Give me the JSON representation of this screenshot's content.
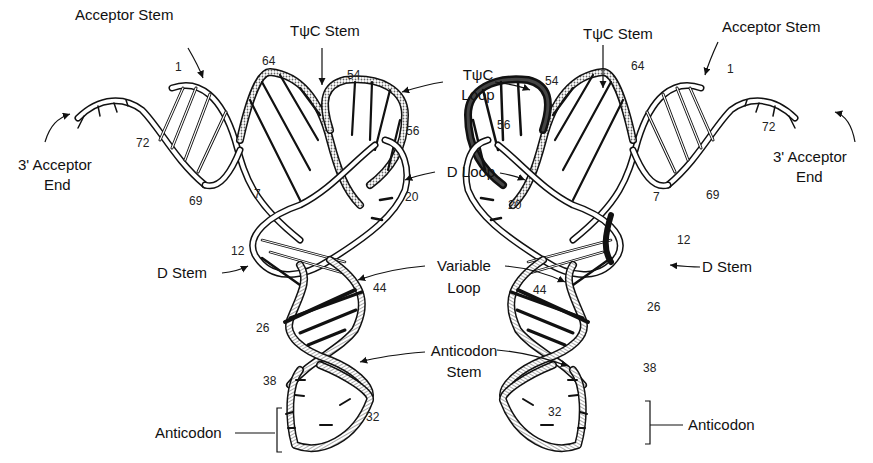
{
  "figure": {
    "colors": {
      "ink": "#111111",
      "background": "#ffffff",
      "stipple": "#8a8a8a",
      "hatch": "#9a9a9a"
    }
  },
  "left_view": {
    "labels": {
      "acceptor_stem": "Acceptor Stem",
      "tpsic_stem": "TψC Stem",
      "acceptor_end_line1": "3' Acceptor",
      "acceptor_end_line2": "End",
      "d_stem": "D Stem",
      "anticodon": "Anticodon"
    },
    "residue_numbers": {
      "n1": "1",
      "n64": "64",
      "n54": "54",
      "n56": "56",
      "n72": "72",
      "n69": "69",
      "n7": "7",
      "n20": "20",
      "n12": "12",
      "n44": "44",
      "n26": "26",
      "n38": "38",
      "n32": "32"
    }
  },
  "center_labels": {
    "tpsic_loop_line1": "TψC",
    "tpsic_loop_line2": "Loop",
    "d_loop": "D Loop",
    "variable_loop_line1": "Variable",
    "variable_loop_line2": "Loop",
    "anticodon_stem_line1": "Anticodon",
    "anticodon_stem_line2": "Stem"
  },
  "right_view": {
    "labels": {
      "acceptor_stem": "Acceptor Stem",
      "tpsic_stem": "TψC Stem",
      "acceptor_end_line1": "3' Acceptor",
      "acceptor_end_line2": "End",
      "d_stem": "D Stem",
      "anticodon": "Anticodon"
    },
    "residue_numbers": {
      "n1": "1",
      "n64": "64",
      "n54": "54",
      "n56": "56",
      "n72": "72",
      "n69": "69",
      "n7": "7",
      "n20": "20",
      "n12": "12",
      "n44": "44",
      "n26": "26",
      "n38": "38",
      "n32": "32"
    }
  }
}
